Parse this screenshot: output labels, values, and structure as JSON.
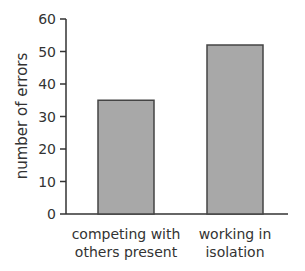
{
  "chart_data": {
    "type": "bar",
    "title": "",
    "xlabel": "",
    "ylabel": "number of errors",
    "categories": [
      "competing with others present",
      "working in isolation"
    ],
    "category_lines": [
      [
        "competing with",
        "others present"
      ],
      [
        "working in",
        "isolation"
      ]
    ],
    "values": [
      35,
      52
    ],
    "ylim": [
      0,
      60
    ],
    "yticks": [
      0,
      10,
      20,
      30,
      40,
      50,
      60
    ],
    "grid": false,
    "legend": null,
    "bar_color": "#a8a8a8",
    "bar_edge_color": "#444444"
  }
}
